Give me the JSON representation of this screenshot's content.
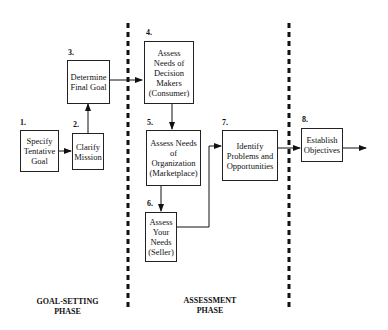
{
  "steps": [
    {
      "num": "1.",
      "label": "Specify Tentative Goal"
    },
    {
      "num": "2.",
      "label": "Clarify Mission"
    },
    {
      "num": "3.",
      "label": "Determine Final Goal"
    },
    {
      "num": "4.",
      "label": "Assess Needs of Decision Makers (Consumer)"
    },
    {
      "num": "5.",
      "label": "Assess Needs of Organization (Marketplace)"
    },
    {
      "num": "6.",
      "label": "Assess Your Needs (Seller)"
    },
    {
      "num": "7.",
      "label": "Identify Problems and Opportunities"
    },
    {
      "num": "8.",
      "label": "Establish Objectives"
    }
  ],
  "phases": [
    {
      "label": "GOAL-SETTING PHASE"
    },
    {
      "label": "ASSESSMENT PHASE"
    }
  ]
}
